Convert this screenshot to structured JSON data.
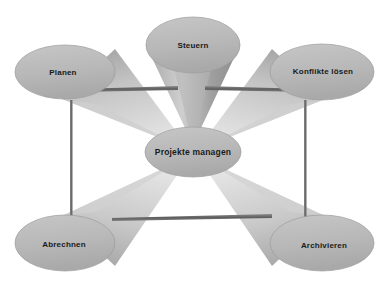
{
  "diagram": {
    "background_color": "#ffffff",
    "node_fill_color": "#b9b9b9",
    "node_edge_color": "#9a9a9a",
    "cone_light_color": "#d8d8d8",
    "cone_dark_color": "#8f8f8f",
    "connector_color": "#6e6e6e",
    "label_color": "#1a1a1a",
    "center_node": {
      "label": "Projekte managen",
      "cx": 193,
      "cy": 152,
      "rx": 48,
      "ry": 25
    },
    "nodes": [
      {
        "id": "planen",
        "label": "Planen",
        "cx": 65,
        "cy": 72,
        "rx": 50,
        "ry": 27
      },
      {
        "id": "steuern",
        "label": "Steuern",
        "cx": 193,
        "cy": 45,
        "rx": 47,
        "ry": 28
      },
      {
        "id": "konflikte-loesen",
        "label": "Konflikte lösen",
        "cx": 322,
        "cy": 72,
        "rx": 52,
        "ry": 28
      },
      {
        "id": "abrechnen",
        "label": "Abrechnen",
        "cx": 65,
        "cy": 243,
        "rx": 50,
        "ry": 28
      },
      {
        "id": "archivieren",
        "label": "Archivieren",
        "cx": 322,
        "cy": 243,
        "rx": 52,
        "ry": 28
      }
    ],
    "connectors": [
      {
        "id": "top-left-bar",
        "orientation": "horizontal"
      },
      {
        "id": "top-right-bar",
        "orientation": "horizontal"
      },
      {
        "id": "bottom-bar",
        "orientation": "horizontal"
      },
      {
        "id": "left-bar",
        "orientation": "vertical"
      },
      {
        "id": "right-bar",
        "orientation": "vertical"
      }
    ]
  }
}
